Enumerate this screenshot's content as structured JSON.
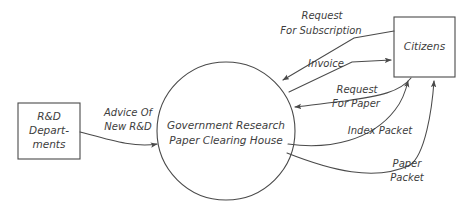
{
  "diagram": {
    "type": "data-flow-diagram",
    "canvas": {
      "width": 470,
      "height": 221,
      "background": "#ffffff"
    },
    "stroke_color": "#4a4a4a",
    "text_color": "#3d3d3d",
    "external_entities": [
      {
        "id": "rnd-departments",
        "lines": [
          "R&D",
          "Depart-",
          "ments"
        ],
        "shape": "rectangle",
        "x": 18,
        "y": 103,
        "width": 62,
        "height": 56
      },
      {
        "id": "citizens",
        "lines": [
          "Citizens"
        ],
        "shape": "rectangle",
        "x": 394,
        "y": 17,
        "width": 61,
        "height": 60
      }
    ],
    "processes": [
      {
        "id": "clearing-house",
        "lines": [
          "Government Research",
          "Paper Clearing House"
        ],
        "shape": "circle",
        "cx": 226,
        "cy": 131,
        "r": 69
      }
    ],
    "flows": [
      {
        "id": "advice-of-new-rnd",
        "lines": [
          "Advice Of",
          "New R&D"
        ],
        "from": "rnd-departments",
        "to": "clearing-house",
        "label_x": 128,
        "label_y": 120
      },
      {
        "id": "request-for-subscription",
        "lines": [
          "Request",
          "For Subscription"
        ],
        "from": "citizens",
        "to": "clearing-house",
        "label_x": 321,
        "label_y": 23
      },
      {
        "id": "invoice",
        "lines": [
          "Invoice"
        ],
        "from": "clearing-house",
        "to": "citizens",
        "label_x": 329,
        "label_y": 63
      },
      {
        "id": "request-for-paper",
        "lines": [
          "Request",
          "For Paper"
        ],
        "from": "citizens",
        "to": "clearing-house",
        "label_x": 356,
        "label_y": 96
      },
      {
        "id": "index-packet",
        "lines": [
          "Index Packet"
        ],
        "from": "clearing-house",
        "to": "citizens",
        "label_x": 380,
        "label_y": 131
      },
      {
        "id": "paper-packet",
        "lines": [
          "Paper",
          "Packet"
        ],
        "from": "clearing-house",
        "to": "citizens",
        "label_x": 408,
        "label_y": 171
      }
    ]
  }
}
